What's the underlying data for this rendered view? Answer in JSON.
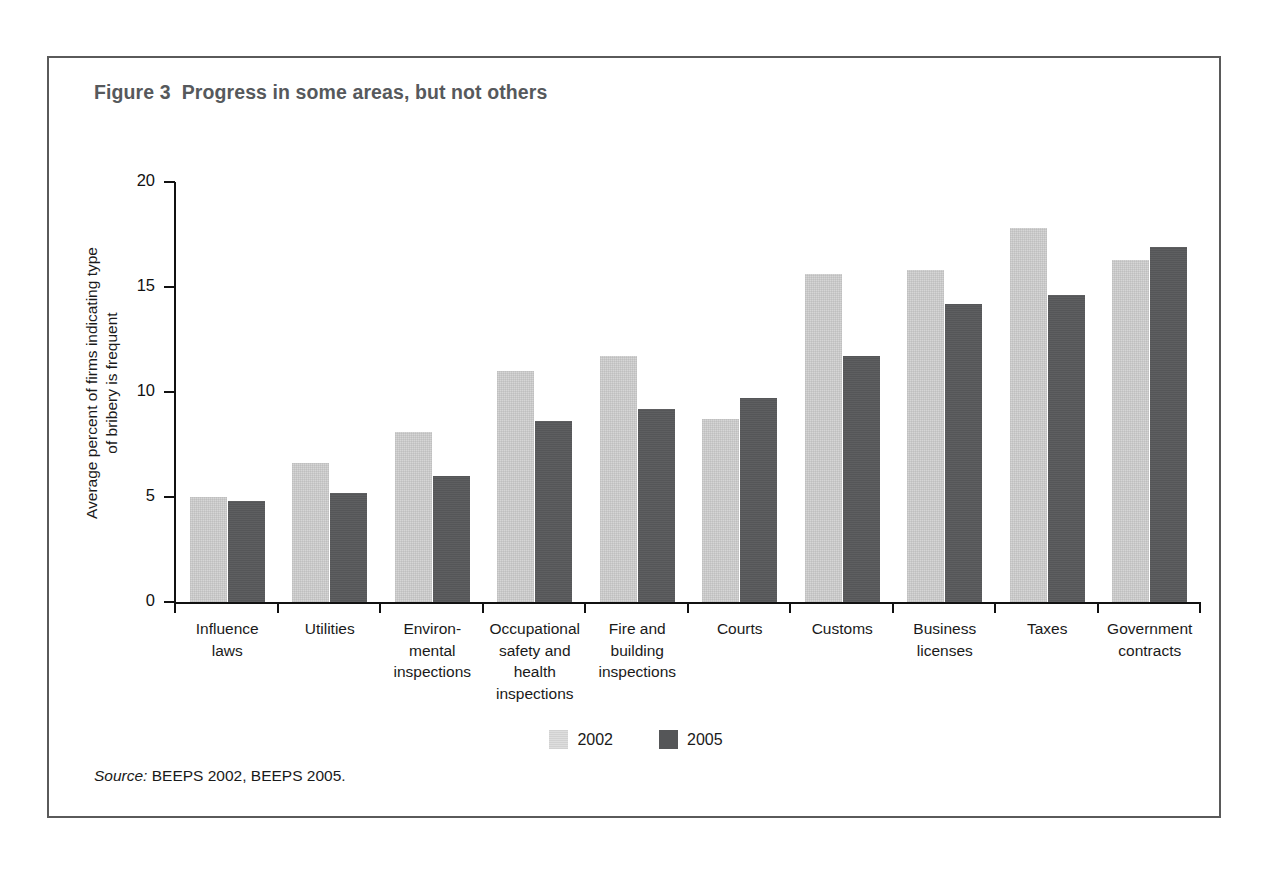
{
  "figure": {
    "title": "Figure 3  Progress in some areas, but not others",
    "source_lead": "Source:",
    "source_text": "BEEPS 2002, BEEPS 2005."
  },
  "colors": {
    "series_2002": "#d6d6d6",
    "series_2005": "#555658",
    "axis": "#111111",
    "frame": "#5a5a5a",
    "title": "#56595c"
  },
  "chart_data": {
    "type": "bar",
    "title": "Figure 3  Progress in some areas, but not others",
    "xlabel": "",
    "ylabel_line1": "Average percent of firms indicating type",
    "ylabel_line2": "of bribery is frequent",
    "ylim": [
      0,
      20
    ],
    "yticks": [
      "0",
      "5",
      "10",
      "15",
      "20"
    ],
    "ytick_values": [
      0,
      5,
      10,
      15,
      20
    ],
    "grid": false,
    "legend_position": "bottom-center",
    "categories": [
      "Influence\nlaws",
      "Utilities",
      "Environ-\nmental\ninspections",
      "Occupational\nsafety and\nhealth\ninspections",
      "Fire and\nbuilding\ninspections",
      "Courts",
      "Customs",
      "Business\nlicenses",
      "Taxes",
      "Government\ncontracts"
    ],
    "series": [
      {
        "name": "2002",
        "color": "#d6d6d6",
        "values": [
          5.0,
          6.6,
          8.1,
          11.0,
          11.7,
          8.7,
          15.6,
          15.8,
          17.8,
          16.3
        ]
      },
      {
        "name": "2005",
        "color": "#555658",
        "values": [
          4.8,
          5.2,
          6.0,
          8.6,
          9.2,
          9.7,
          11.7,
          14.2,
          14.6,
          16.9
        ]
      }
    ]
  }
}
